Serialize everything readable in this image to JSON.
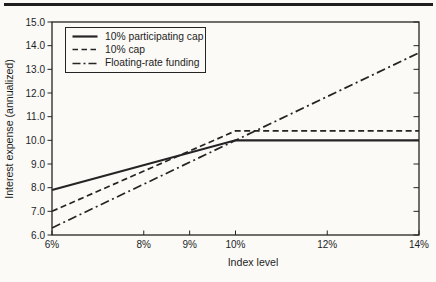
{
  "figure": {
    "ink_color": "#242424",
    "paper_color": "#fbfaf7",
    "top_rule": "divider-bar"
  },
  "chart_data": {
    "type": "line",
    "title": "",
    "xlabel": "Index level",
    "ylabel": "Interest expense (annualized)",
    "xlim": [
      6,
      14
    ],
    "ylim": [
      6,
      15
    ],
    "x_ticks": [
      6,
      8,
      9,
      10,
      12,
      14
    ],
    "x_tick_labels": [
      "6%",
      "8%",
      "9%",
      "10%",
      "12%",
      "14%"
    ],
    "y_ticks": [
      6,
      7,
      8,
      9,
      10,
      11,
      12,
      13,
      14,
      15
    ],
    "y_tick_labels": [
      "6.0",
      "7.0",
      "8.0",
      "9.0",
      "10.0",
      "11.0",
      "12.0",
      "13.0",
      "14.0",
      "15.0"
    ],
    "grid": false,
    "legend": {
      "position": "upper-left-inside"
    },
    "series": [
      {
        "name": "10% participating cap",
        "style": "solid",
        "color": "#242424",
        "points": [
          [
            6,
            7.9
          ],
          [
            10,
            10.0
          ],
          [
            14,
            10.0
          ]
        ]
      },
      {
        "name": "10% cap",
        "style": "dashed",
        "color": "#242424",
        "points": [
          [
            6,
            7.0
          ],
          [
            10,
            10.4
          ],
          [
            14,
            10.4
          ]
        ]
      },
      {
        "name": "Floating-rate funding",
        "style": "dashdot",
        "color": "#242424",
        "points": [
          [
            6,
            6.3
          ],
          [
            14,
            13.7
          ]
        ]
      }
    ]
  }
}
